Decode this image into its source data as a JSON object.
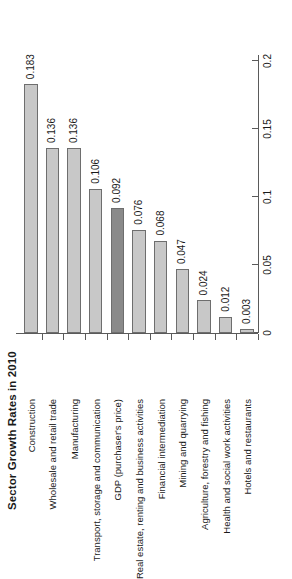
{
  "chart_data": {
    "type": "bar",
    "orientation": "horizontal",
    "title": "Sector Growth Rates in 2010",
    "xlabel": "",
    "ylabel": "",
    "xlim": [
      0,
      0.2
    ],
    "grid": false,
    "legend": null,
    "value_axis_ticks": [
      "0",
      "0.05",
      "0.1",
      "0.15",
      "0.2"
    ],
    "value_axis_tick_values": [
      0,
      0.05,
      0.1,
      0.15,
      0.2
    ],
    "categories": [
      "Construction",
      "Wholesale and retail trade",
      "Manufacturing",
      "Transport, storage and communication",
      "GDP (purchaser's price)",
      "Real estate, renting and business activities",
      "Financial intermediation",
      "Mining and quarrying",
      "Agriculture, forestry and fishing",
      "Health and social work activities",
      "Hotels and restaurants"
    ],
    "values": [
      0.183,
      0.136,
      0.136,
      0.106,
      0.092,
      0.076,
      0.068,
      0.047,
      0.024,
      0.012,
      0.003
    ],
    "value_labels": [
      "0.183",
      "0.136",
      "0.136",
      "0.106",
      "0.092",
      "0.076",
      "0.068",
      "0.047",
      "0.024",
      "0.012",
      "0.003"
    ],
    "highlight_index": 4,
    "colors": {
      "bar_fill": "#c8c8c8",
      "bar_highlight_fill": "#8a8a8a",
      "bar_border": "#6e6e6e",
      "axis": "#5a5a5a",
      "text": "#1a1a1a",
      "background": "#ffffff"
    }
  }
}
